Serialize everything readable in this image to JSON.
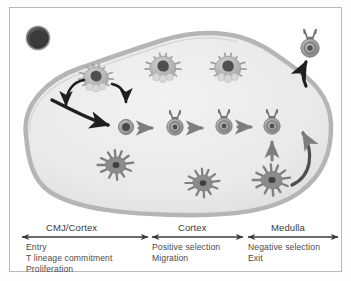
{
  "figure": {
    "organ": {
      "name": "thymus-lobe",
      "capsule_color": "#b5b5b5",
      "interior_color": "#e8e8e8"
    },
    "colors": {
      "progenitor": "#4a4a4a",
      "thymocyte_body": "#9a9a9a",
      "thymocyte_core": "#555555",
      "epithelial_cell": "#b0b0b0",
      "epithelial_nucleus": "#4f4f4f",
      "dendritic_cell": "#8b8b8b",
      "arrow_dark": "#1f1f1f",
      "arrow_mid": "#7d7d7d",
      "capsule": "#b5b5b5",
      "frame": "#b9b9b9",
      "text": "#3a3a3a"
    },
    "cells": [
      {
        "id": "progenitor",
        "label": "progenitor-cell",
        "type": "filled-dark-circle"
      },
      {
        "id": "epithelial-1",
        "label": "thymic-epithelial-cell",
        "type": "spiky-stellate-cell"
      },
      {
        "id": "epithelial-2",
        "label": "thymic-epithelial-cell",
        "type": "spiky-stellate-cell"
      },
      {
        "id": "epithelial-3",
        "label": "thymic-epithelial-cell",
        "type": "spiky-stellate-cell"
      },
      {
        "id": "thymocyte-early",
        "label": "early-thymocyte",
        "type": "small-dark-circle"
      },
      {
        "id": "thymocyte-tcr-1",
        "label": "thymocyte-with-tcr",
        "type": "ringed-cell-with-receptors"
      },
      {
        "id": "thymocyte-tcr-2",
        "label": "thymocyte-with-tcr",
        "type": "ringed-cell-with-receptors"
      },
      {
        "id": "thymocyte-tcr-3",
        "label": "thymocyte-with-tcr",
        "type": "ringed-cell-with-receptors"
      },
      {
        "id": "mature-t-cell",
        "label": "mature-t-cell-exiting",
        "type": "ringed-cell-with-receptors"
      },
      {
        "id": "dendritic-1",
        "label": "dendritic-cell",
        "type": "starburst-cell"
      },
      {
        "id": "dendritic-2",
        "label": "dendritic-cell",
        "type": "starburst-cell"
      },
      {
        "id": "dendritic-3",
        "label": "dendritic-cell",
        "type": "starburst-cell"
      }
    ],
    "regions": [
      {
        "id": "cmj-cortex",
        "title": "CMJ/Cortex",
        "events": [
          "Entry",
          "T lineage commitment",
          "Proliferation"
        ]
      },
      {
        "id": "cortex",
        "title": "Cortex",
        "events": [
          "Positive selection",
          "Migration"
        ]
      },
      {
        "id": "medulla",
        "title": "Medulla",
        "events": [
          "Negative selection",
          "Exit"
        ]
      }
    ]
  }
}
